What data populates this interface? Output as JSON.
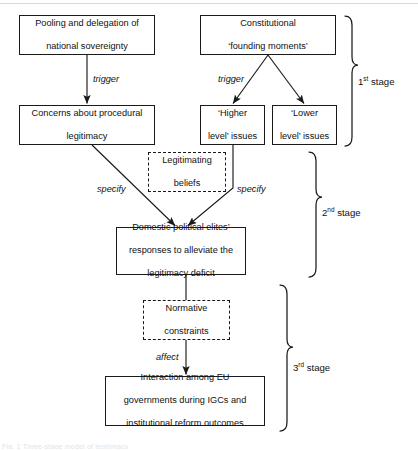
{
  "figure": {
    "type": "flow-diagram",
    "caption_fragment": "Fig. 1   Three-stage model of legitimacy",
    "nodes": [
      {
        "id": "pooling",
        "label": "Pooling and delegation of national sovereignty",
        "lines": [
          "Pooling and delegation of",
          "national sovereignty"
        ],
        "style": "solid",
        "x": 19,
        "y": 15,
        "w": 136,
        "h": 40
      },
      {
        "id": "constitutional",
        "label": "Constitutional 'founding moments'",
        "lines": [
          "Constitutional",
          "‘founding moments’"
        ],
        "style": "solid",
        "x": 200,
        "y": 15,
        "w": 136,
        "h": 40
      },
      {
        "id": "concerns",
        "label": "Concerns about procedural legitimacy",
        "lines": [
          "Concerns about procedural",
          "legitimacy"
        ],
        "style": "solid",
        "x": 19,
        "y": 105,
        "w": 136,
        "h": 40
      },
      {
        "id": "higher",
        "label": "'Higher level' issues",
        "lines": [
          "‘Higher",
          "level’ issues"
        ],
        "style": "solid",
        "x": 200,
        "y": 105,
        "w": 65,
        "h": 40
      },
      {
        "id": "lower",
        "label": "'Lower level' issues",
        "lines": [
          "‘Lower",
          "level’ issues"
        ],
        "style": "solid",
        "x": 272,
        "y": 105,
        "w": 65,
        "h": 40
      },
      {
        "id": "legitimating",
        "label": "Legitimating beliefs",
        "lines": [
          "Legitimating",
          "beliefs"
        ],
        "style": "dashed",
        "x": 148,
        "y": 152,
        "w": 78,
        "h": 40
      },
      {
        "id": "domestic",
        "label": "Domestic political elites' responses to alleviate the legitimacy deficit",
        "lines": [
          "Domestic political elites’",
          "responses to alleviate the",
          "legitimacy deficit"
        ],
        "style": "solid",
        "x": 116,
        "y": 227,
        "w": 130,
        "h": 48
      },
      {
        "id": "normative",
        "label": "Normative constraints",
        "lines": [
          "Normative",
          "constraints"
        ],
        "style": "dashed",
        "x": 143,
        "y": 300,
        "w": 87,
        "h": 40
      },
      {
        "id": "interaction",
        "label": "Interaction among EU governments during IGCs and institutional reform outcomes",
        "lines": [
          "Interaction among EU",
          "governments during IGCs and",
          "institutional reform outcomes"
        ],
        "style": "solid",
        "x": 105,
        "y": 376,
        "w": 160,
        "h": 50
      }
    ],
    "edge_labels": [
      {
        "id": "trigger-left",
        "text": "trigger",
        "x": 93,
        "y": 74
      },
      {
        "id": "trigger-right",
        "text": "trigger",
        "x": 218,
        "y": 74
      },
      {
        "id": "specify-left",
        "text": "specify",
        "x": 97,
        "y": 184
      },
      {
        "id": "specify-right",
        "text": "specify",
        "x": 237,
        "y": 184
      },
      {
        "id": "affect",
        "text": "affect",
        "x": 156,
        "y": 352
      }
    ],
    "stages": [
      {
        "id": "stage-1",
        "ordinal": "1",
        "suffix": "st",
        "word": "stage",
        "label": "1st stage",
        "label_x": 358,
        "label_y": 76,
        "brace_x": 345,
        "brace_top": 16,
        "brace_bottom": 146
      },
      {
        "id": "stage-2",
        "ordinal": "2",
        "suffix": "nd",
        "word": "stage",
        "label": "2nd stage",
        "label_x": 322,
        "label_y": 207,
        "brace_x": 309,
        "brace_top": 152,
        "brace_bottom": 277
      },
      {
        "id": "stage-3",
        "ordinal": "3",
        "suffix": "rd",
        "word": "stage",
        "label": "3rd stage",
        "label_x": 293,
        "label_y": 362,
        "brace_x": 280,
        "brace_top": 285,
        "brace_bottom": 431
      }
    ],
    "colors": {
      "stroke": "#1a1a1a",
      "text": "#111111",
      "background": "#ffffff"
    }
  }
}
